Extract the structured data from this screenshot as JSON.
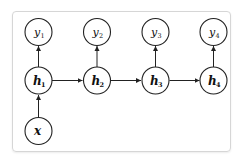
{
  "diagram": {
    "type": "rnn-unrolled",
    "nodes": {
      "outputs": [
        {
          "id": "y1",
          "base": "y",
          "sub": "1"
        },
        {
          "id": "y2",
          "base": "y",
          "sub": "2"
        },
        {
          "id": "y3",
          "base": "y",
          "sub": "3"
        },
        {
          "id": "y4",
          "base": "y",
          "sub": "4"
        }
      ],
      "hidden": [
        {
          "id": "h1",
          "base": "h",
          "sub": "1"
        },
        {
          "id": "h2",
          "base": "h",
          "sub": "2"
        },
        {
          "id": "h3",
          "base": "h",
          "sub": "3"
        },
        {
          "id": "h4",
          "base": "h",
          "sub": "4"
        }
      ],
      "input": {
        "id": "x",
        "base": "x"
      }
    },
    "edges": [
      [
        "x",
        "h1"
      ],
      [
        "h1",
        "h2"
      ],
      [
        "h2",
        "h3"
      ],
      [
        "h3",
        "h4"
      ],
      [
        "h1",
        "y1"
      ],
      [
        "h2",
        "y2"
      ],
      [
        "h3",
        "y3"
      ],
      [
        "h4",
        "y4"
      ]
    ]
  }
}
